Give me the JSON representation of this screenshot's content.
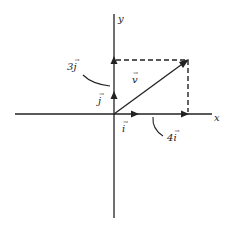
{
  "diagram": {
    "axes": {
      "x_label": "x",
      "y_label": "y"
    },
    "vectors": {
      "i_unit": {
        "label": "i",
        "arrow": "→"
      },
      "j_unit": {
        "label": "j",
        "arrow": "→"
      },
      "v": {
        "label": "v",
        "arrow": "→"
      },
      "four_i": {
        "coef": "4",
        "label": "i",
        "arrow": "→"
      },
      "three_j": {
        "coef": "3",
        "label": "j",
        "arrow": "→"
      }
    },
    "colors": {
      "stroke": "#222222",
      "background": "#ffffff"
    }
  }
}
